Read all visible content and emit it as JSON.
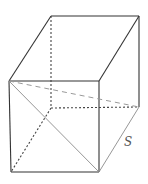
{
  "figure": {
    "edge_label": "S"
  }
}
